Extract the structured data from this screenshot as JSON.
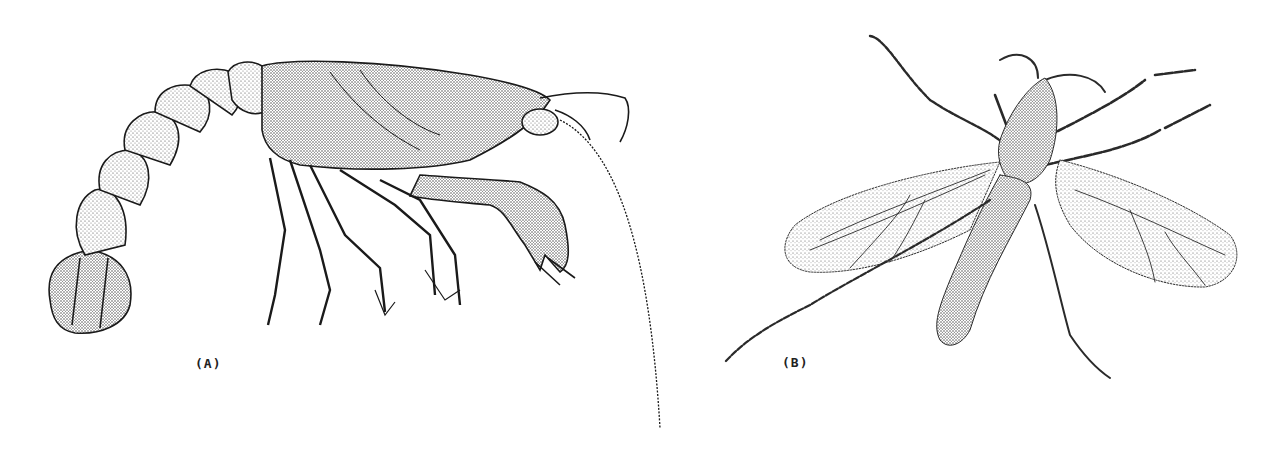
{
  "figure": {
    "panels": [
      {
        "id": "A",
        "label": "(A)",
        "subject": "crayfish illustration"
      },
      {
        "id": "B",
        "label": "(B)",
        "subject": "winged insect illustration"
      }
    ]
  },
  "colors": {
    "background": "#ffffff",
    "ink": "#1a1a1a",
    "stipple": "#555555"
  }
}
